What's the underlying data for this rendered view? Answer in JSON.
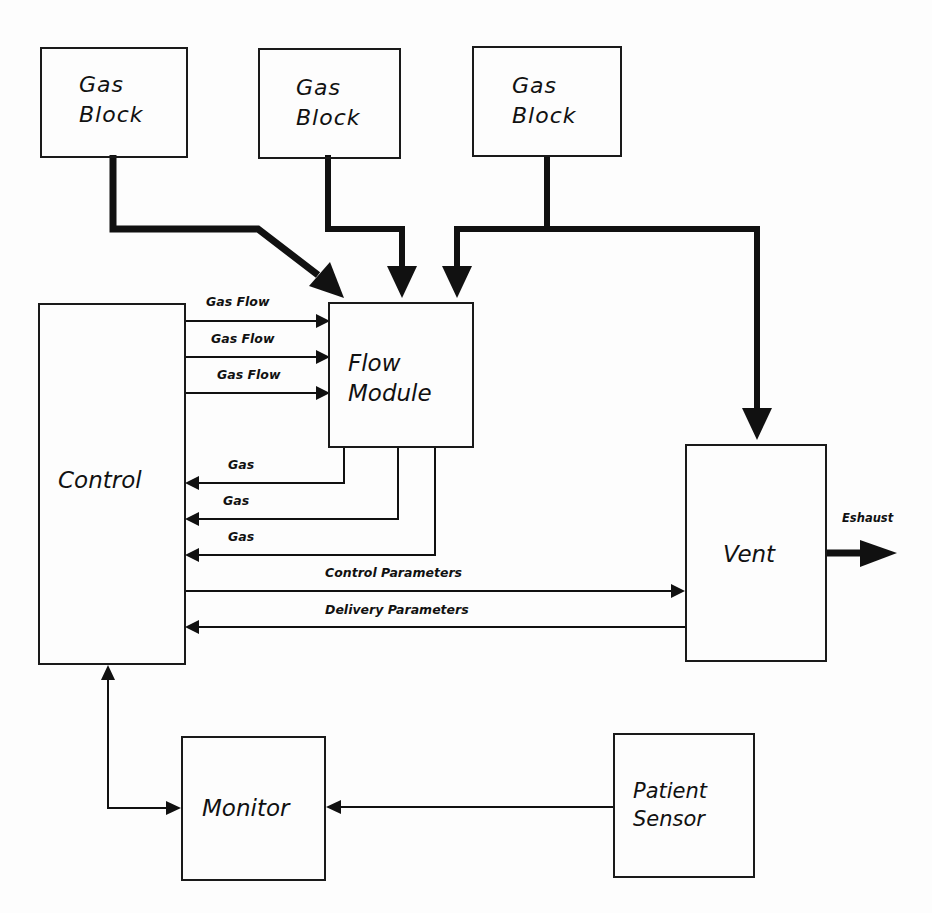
{
  "diagram": {
    "type": "block-diagram",
    "nodes": {
      "gas_block_1": {
        "line1": "Gas",
        "line2": "Block"
      },
      "gas_block_2": {
        "line1": "Gas",
        "line2": "Block"
      },
      "gas_block_3": {
        "line1": "Gas",
        "line2": "Block"
      },
      "flow_module": {
        "line1": "Flow",
        "line2": "Module"
      },
      "control": {
        "label": "Control"
      },
      "vent": {
        "label": "Vent"
      },
      "monitor": {
        "label": "Monitor"
      },
      "patient_sensor": {
        "line1": "Patient",
        "line2": "Sensor"
      }
    },
    "edges": {
      "gas_flow_1": "Gas Flow",
      "gas_flow_2": "Gas Flow",
      "gas_flow_3": "Gas Flow",
      "gas_return_1": "Gas",
      "gas_return_2": "Gas",
      "gas_return_3": "Gas",
      "control_parameters": "Control Parameters",
      "delivery_parameters": "Delivery Parameters",
      "exhaust": "Eshaust"
    },
    "connections": [
      {
        "from": "gas_block_1",
        "to": "flow_module",
        "style": "thick"
      },
      {
        "from": "gas_block_2",
        "to": "flow_module",
        "style": "thick"
      },
      {
        "from": "gas_block_3",
        "to": "flow_module",
        "style": "thick"
      },
      {
        "from": "gas_block_3",
        "to": "vent",
        "style": "thick"
      },
      {
        "from": "control",
        "to": "flow_module",
        "label": "Gas Flow",
        "count": 3
      },
      {
        "from": "flow_module",
        "to": "control",
        "label": "Gas",
        "count": 3
      },
      {
        "from": "control",
        "to": "vent",
        "label": "Control Parameters"
      },
      {
        "from": "vent",
        "to": "control",
        "label": "Delivery Parameters"
      },
      {
        "from": "vent",
        "to": "exhaust",
        "label": "Eshaust",
        "style": "thick"
      },
      {
        "from": "monitor",
        "to": "control",
        "style": "bidirectional"
      },
      {
        "from": "patient_sensor",
        "to": "monitor"
      }
    ]
  }
}
